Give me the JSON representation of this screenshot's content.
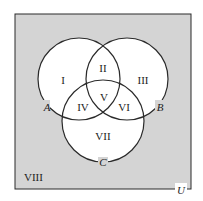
{
  "diagram": {
    "type": "venn-3",
    "colors": {
      "universe_fill": "#d4d4d4",
      "circle_fill": "#ffffff",
      "stroke": "#2a2a2a"
    },
    "universe_label": "U",
    "sets": [
      {
        "label": "A"
      },
      {
        "label": "B"
      },
      {
        "label": "C"
      }
    ],
    "regions": [
      "I",
      "II",
      "III",
      "IV",
      "V",
      "VI",
      "VII",
      "VIII"
    ]
  }
}
